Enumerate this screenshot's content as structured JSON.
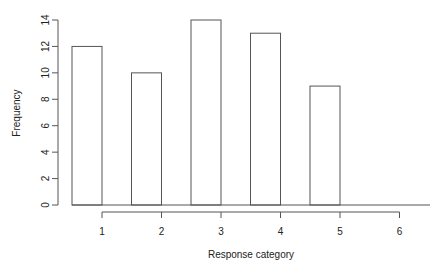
{
  "chart_data": {
    "type": "bar",
    "title": "",
    "xlabel": "Response category",
    "ylabel": "Frequency",
    "categories": [
      "1",
      "2",
      "3",
      "4",
      "5",
      "6"
    ],
    "values": [
      12,
      10,
      14,
      13,
      9,
      0
    ],
    "bars": [
      {
        "category": "1",
        "value": 12
      },
      {
        "category": "2",
        "value": 10
      },
      {
        "category": "3",
        "value": 14
      },
      {
        "category": "4",
        "value": 13
      },
      {
        "category": "5",
        "value": 9
      }
    ],
    "yticks": [
      0,
      2,
      4,
      6,
      8,
      10,
      12,
      14
    ],
    "xticks": [
      1,
      2,
      3,
      4,
      5,
      6
    ],
    "ylim": [
      0,
      14
    ],
    "grid": false,
    "legend": null
  },
  "colors": {
    "bar_fill": "#ffffff",
    "bar_stroke": "#555555",
    "axis": "#555555",
    "text": "#222222"
  }
}
